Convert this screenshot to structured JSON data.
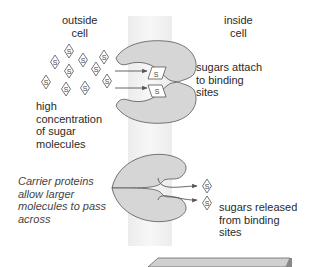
{
  "labels": {
    "outside_cell": [
      "outside",
      "cell"
    ],
    "inside_cell": [
      "inside",
      "cell"
    ],
    "sugars_attach": [
      "sugars attach",
      "to binding",
      "sites"
    ],
    "high_concentration": [
      "high",
      "concentration",
      "of sugar",
      "molecules"
    ],
    "carrier_proteins": [
      "Carrier proteins",
      "allow larger",
      "molecules to pass",
      "across"
    ],
    "sugars_released": [
      "sugars released",
      "from binding",
      "sites"
    ]
  },
  "molecule_symbol": "S",
  "colors": {
    "protein_fill": "#d6d6d6",
    "outline": "#444444",
    "membrane": "#eeeeee",
    "slab": "#c8c8c8"
  }
}
